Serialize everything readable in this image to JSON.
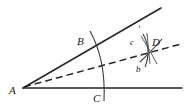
{
  "figure": {
    "stroke_color": "#262626",
    "background_color": "#ffffff",
    "labels": {
      "vertex_a": "A",
      "point_b": "B",
      "point_c": "C",
      "point_d": "D",
      "arc_b_mark": "b",
      "arc_c_mark": "c"
    },
    "geometry": {
      "vertex": {
        "x": 23,
        "y": 88
      },
      "upper_ray_end": {
        "x": 161,
        "y": 8
      },
      "lower_ray_end": {
        "x": 182,
        "y": 88
      },
      "bisector_end": {
        "x": 181,
        "y": 44
      },
      "point_b": {
        "x": 95,
        "y": 46
      },
      "point_c": {
        "x": 103,
        "y": 88
      },
      "point_d": {
        "x": 149,
        "y": 50
      },
      "main_arc_start": {
        "x": 90,
        "y": 31
      },
      "main_arc_end": {
        "x": 104,
        "y": 101
      }
    },
    "label_positions": {
      "A": {
        "x": 9,
        "y": 94
      },
      "B": {
        "x": 77,
        "y": 45
      },
      "C": {
        "x": 93,
        "y": 102
      },
      "D": {
        "x": 152,
        "y": 46
      },
      "b": {
        "x": 136,
        "y": 72
      },
      "c": {
        "x": 130,
        "y": 45
      }
    }
  }
}
